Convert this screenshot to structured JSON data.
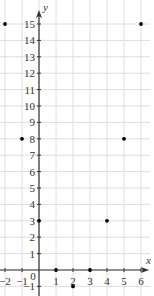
{
  "chart_data": {
    "type": "scatter",
    "title": "",
    "xlabel": "x",
    "ylabel": "y",
    "xlim": [
      -2,
      6
    ],
    "ylim": [
      -1,
      15
    ],
    "grid": true,
    "legend": null,
    "x_ticks": [
      -2,
      -1,
      0,
      1,
      2,
      3,
      4,
      5,
      6
    ],
    "x_tick_labels": [
      "−2",
      "−1",
      "0",
      "1",
      "2",
      "3",
      "4",
      "5",
      "6"
    ],
    "y_ticks": [
      -1,
      1,
      2,
      3,
      4,
      5,
      6,
      7,
      8,
      9,
      10,
      11,
      12,
      13,
      14,
      15
    ],
    "y_tick_labels": [
      "−1",
      "1",
      "2",
      "3",
      "4",
      "5",
      "6",
      "7",
      "8",
      "9",
      "10",
      "11",
      "12",
      "13",
      "14",
      "15"
    ],
    "series": [
      {
        "name": "points",
        "color": "#000000",
        "x": [
          -2,
          -1,
          0,
          1,
          2,
          3,
          4,
          5,
          6
        ],
        "y": [
          15,
          8,
          3,
          0,
          -1,
          0,
          3,
          8,
          15
        ]
      }
    ]
  },
  "colors": {
    "grid": "#dedede",
    "axis": "#333333",
    "point": "#000000"
  }
}
